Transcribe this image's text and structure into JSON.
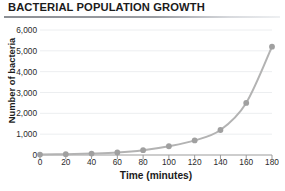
{
  "chart_data": {
    "type": "line",
    "title": "BACTERIAL POPULATION GROWTH",
    "xlabel": "Time (minutes)",
    "ylabel": "Number of bacteria",
    "x": [
      0,
      20,
      40,
      60,
      80,
      100,
      120,
      140,
      160,
      180
    ],
    "values": [
      20,
      40,
      70,
      120,
      230,
      420,
      700,
      1200,
      2500,
      5200
    ],
    "series": [
      {
        "name": "Bacteria count",
        "values": [
          20,
          40,
          70,
          120,
          230,
          420,
          700,
          1200,
          2500,
          5200
        ]
      }
    ],
    "xlim": [
      0,
      180
    ],
    "ylim": [
      0,
      6000
    ],
    "xticks": [
      0,
      20,
      40,
      60,
      80,
      100,
      120,
      140,
      160,
      180
    ],
    "xtick_labels": [
      "0",
      "20",
      "40",
      "60",
      "80",
      "100",
      "120",
      "140",
      "160",
      "180"
    ],
    "yticks": [
      0,
      1000,
      2000,
      3000,
      4000,
      5000,
      6000
    ],
    "ytick_labels": [
      "0",
      "1,000",
      "2,000",
      "3,000",
      "4,000",
      "5,000",
      "6,000"
    ],
    "grid": "horizontal",
    "legend": "none",
    "marker": "circle",
    "colors": {
      "line": "#b3b3b3",
      "marker": "#a0a0a0",
      "grid": "#eceef0",
      "axis": "#9b9b9b",
      "text": "#1b1b1b"
    }
  }
}
